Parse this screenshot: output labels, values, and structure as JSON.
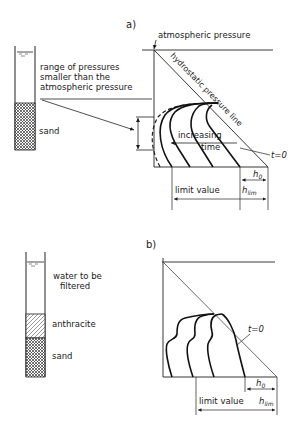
{
  "figure_a": {
    "panel_label": "a)",
    "column": {
      "layers": [
        {
          "name": "water",
          "label": ""
        },
        {
          "name": "sand",
          "label": "sand"
        }
      ],
      "annotation": [
        "range of pressures",
        "smaller than the",
        "atmospheric pressure"
      ]
    },
    "plot": {
      "top_label": "atmospheric pressure",
      "diagonal_label": "hydrostatic pressure line",
      "arrow_label_line1": "increasing",
      "arrow_label_line2": "time",
      "t0_label": "t=0",
      "h0_label": "h",
      "h0_sub": "0",
      "limit_label": "limit value",
      "hlim_label": "h",
      "hlim_sub": "lim"
    }
  },
  "figure_b": {
    "panel_label": "b)",
    "column": {
      "layers": [
        {
          "name": "water",
          "label_line1": "water to be",
          "label_line2": "filtered"
        },
        {
          "name": "anthracite",
          "label": "anthracite"
        },
        {
          "name": "sand",
          "label": "sand"
        }
      ]
    },
    "plot": {
      "t0_label": "t=0",
      "h0_label": "h",
      "h0_sub": "0",
      "limit_label": "limit value",
      "hlim_label": "h",
      "hlim_sub": "lim"
    }
  }
}
